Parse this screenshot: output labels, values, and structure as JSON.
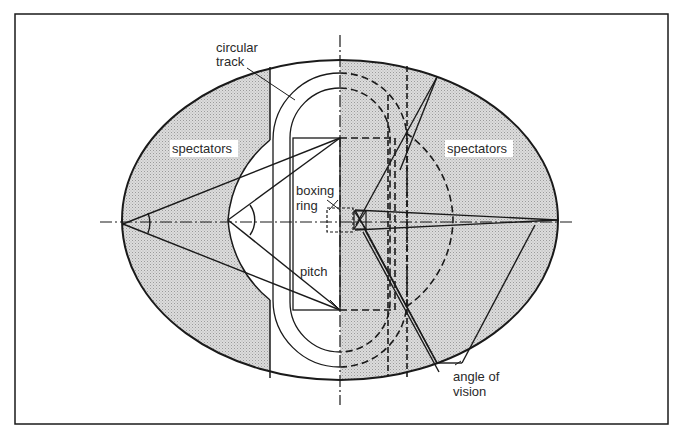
{
  "figure": {
    "type": "stadium-plan-diagram",
    "labels": {
      "circular_track_line1": "circular",
      "circular_track_line2": "track",
      "spectators_left": "spectators",
      "spectators_right": "spectators",
      "boxing_ring_line1": "boxing",
      "boxing_ring_line2": "ring",
      "pitch": "pitch",
      "angle_of_vision_line1": "angle of",
      "angle_of_vision_line2": "vision"
    },
    "colors": {
      "line": "#1a1a1a",
      "shade": "#d4d4d4",
      "background": "#ffffff",
      "text": "#2a2a2a"
    }
  }
}
